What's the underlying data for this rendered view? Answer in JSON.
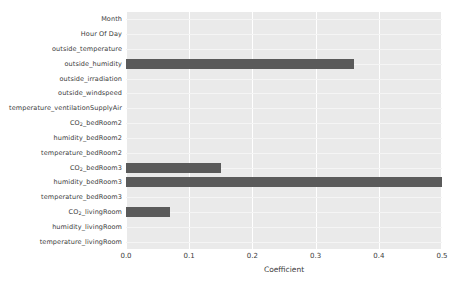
{
  "chart_data": {
    "type": "bar",
    "orientation": "horizontal",
    "title": "",
    "xlabel": "Coefficient",
    "ylabel": "",
    "xlim": [
      0.0,
      0.5
    ],
    "xticks": [
      "0.0",
      "0.1",
      "0.2",
      "0.3",
      "0.4",
      "0.5"
    ],
    "xtick_values": [
      0.0,
      0.1,
      0.2,
      0.3,
      0.4,
      0.5
    ],
    "grid": true,
    "legend": false,
    "bar_color": "#5a5a5a",
    "plot_background": "#eaeaea",
    "figure_background": "#ffffff",
    "categories": [
      "Month",
      "Hour Of Day",
      "outside_temperature",
      "outside_humidity",
      "outside_irradiation",
      "outside_windspeed",
      "temperature_ventilationSupplyAir",
      "CO₂_bedRoom2",
      "humidity_bedRoom2",
      "temperature_bedRoom2",
      "CO₂_bedRoom3",
      "humidity_bedRoom3",
      "temperature_bedRoom3",
      "CO₂_livingRoom",
      "humidity_livingRoom",
      "temperature_livingRoom"
    ],
    "values": [
      0.0,
      0.0,
      0.0,
      0.36,
      0.0,
      0.0,
      0.0,
      0.0,
      0.0,
      0.0,
      0.15,
      0.5,
      0.0,
      0.07,
      0.0,
      0.0
    ]
  }
}
